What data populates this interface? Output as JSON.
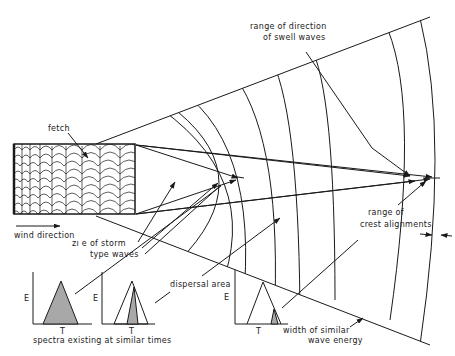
{
  "diagram": {
    "labels": {
      "fetch": "fetch",
      "wind_direction": "wind direction",
      "zone_storm_line1": "zı e of storm",
      "zone_storm_line2": "type waves",
      "range_direction_line1": "range of direction",
      "range_direction_line2": "of swell waves",
      "range_crest_line1": "range of",
      "range_crest_line2": "crest alignments",
      "dispersal_area": "dispersal area",
      "width_energy_line1": "width of similar",
      "width_energy_line2": "wave energy",
      "spectra_caption": "spectra existing at similar times"
    },
    "spectra": [
      {
        "axis_y": "E",
        "axis_x": "T",
        "type": "broad"
      },
      {
        "axis_y": "E",
        "axis_x": "T",
        "type": "narrowing"
      },
      {
        "axis_y": "E",
        "axis_x": "T",
        "type": "narrow"
      }
    ],
    "colors": {
      "ink": "#1a1a1a",
      "shade": "#a8a8a8",
      "background": "#ffffff"
    }
  }
}
